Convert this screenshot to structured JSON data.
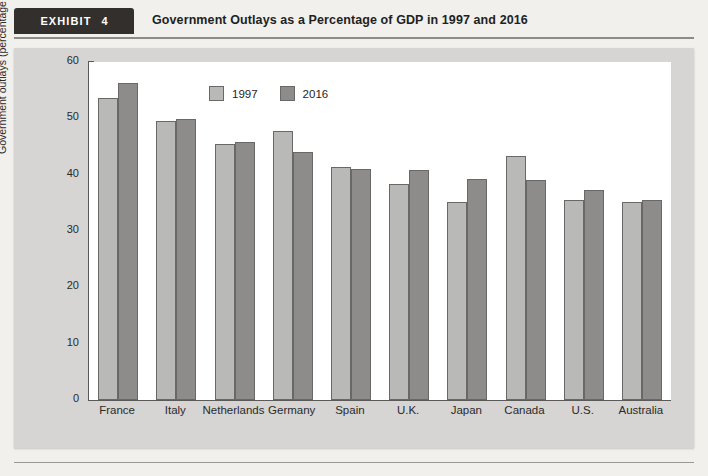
{
  "header": {
    "exhibit_label": "EXHIBIT",
    "exhibit_number": "4",
    "title": "Government Outlays as a Percentage of GDP in 1997 and 2016"
  },
  "colors": {
    "page_background": "#f2f0ec",
    "panel_background": "#d6d5d3",
    "plot_background": "#ffffff",
    "series_1997": "#b9b9b8",
    "series_2016": "#8d8c8b",
    "axis": "#5c5a58",
    "tab_background": "#332f2d",
    "text": "#2b2a29"
  },
  "legend": {
    "position": "top-left-inside",
    "items": [
      {
        "label": "1997",
        "color": "#b9b9b8"
      },
      {
        "label": "2016",
        "color": "#8d8c8b"
      }
    ]
  },
  "chart_data": {
    "type": "bar",
    "title": "Government Outlays as a Percentage of GDP in 1997 and 2016",
    "xlabel": "",
    "ylabel": "Government outlays (percentage of GDP)",
    "ylim": [
      0,
      60
    ],
    "yticks": [
      0,
      10,
      20,
      30,
      40,
      50,
      60
    ],
    "ytick_labels": [
      "0",
      "10",
      "20",
      "30",
      "40",
      "50",
      "60"
    ],
    "grid": false,
    "categories": [
      "France",
      "Italy",
      "Netherlands",
      "Germany",
      "Spain",
      "U.K.",
      "Japan",
      "Canada",
      "U.S.",
      "Australia"
    ],
    "series": [
      {
        "name": "1997",
        "color": "#b9b9b8",
        "values": [
          53.6,
          49.6,
          45.5,
          47.8,
          41.4,
          38.3,
          35.1,
          43.3,
          35.5,
          35.1
        ]
      },
      {
        "name": "2016",
        "color": "#8d8c8b",
        "values": [
          56.2,
          49.9,
          45.8,
          44.0,
          41.0,
          40.9,
          39.2,
          39.0,
          37.3,
          35.5
        ]
      }
    ]
  }
}
